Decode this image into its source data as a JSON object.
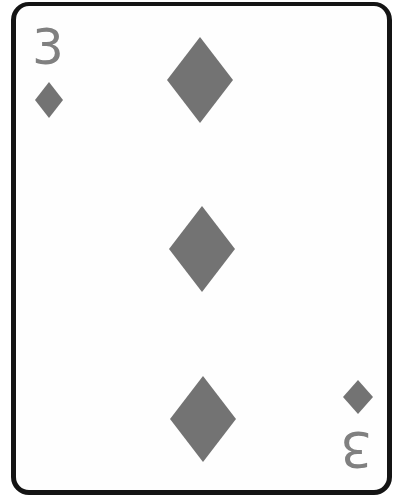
{
  "card": {
    "rank": "3",
    "suit": "diamonds",
    "suit_icon": "diamond-icon",
    "colors": {
      "pip_fill": "#737373",
      "rank_text": "#808080",
      "border": "#141414",
      "face": "#fefefe"
    },
    "pip_count": 3,
    "corner_index": {
      "top_left": {
        "rank": "3",
        "suit": "diamonds"
      },
      "bottom_right": {
        "rank": "3",
        "suit": "diamonds",
        "rotated": true
      }
    }
  }
}
